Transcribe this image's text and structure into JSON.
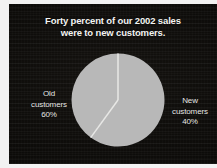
{
  "slide": {
    "background_color": "#0b0a08",
    "text_color": "#f4f4f2",
    "pie_fill_color": "#b8b8b8",
    "pie_divider_color": "#e8e8e6"
  },
  "title": {
    "line1": "Forty percent of our 2002 sales",
    "line2": "were to new customers."
  },
  "labels": {
    "old": {
      "name_line1": "Old",
      "name_line2": "customers",
      "percent": "60%"
    },
    "new": {
      "name_line1": "New",
      "name_line2": "customers",
      "percent": "40%"
    }
  },
  "chart_data": {
    "type": "pie",
    "title": "Forty percent of our 2002 sales were to new customers.",
    "xlabel": "",
    "ylabel": "",
    "legend_position": "outside-left-and-right",
    "grid": false,
    "categories": [
      "Old customers",
      "New customers"
    ],
    "values": [
      60,
      40
    ],
    "units": "percent",
    "slices": [
      {
        "label": "Old customers",
        "value": 60,
        "display_percent": "60%",
        "color": "#b8b8b8",
        "start_angle_deg": 144,
        "end_angle_deg": 360
      },
      {
        "label": "New customers",
        "value": 40,
        "display_percent": "40%",
        "color": "#b8b8b8",
        "start_angle_deg": 0,
        "end_angle_deg": 144
      }
    ]
  }
}
